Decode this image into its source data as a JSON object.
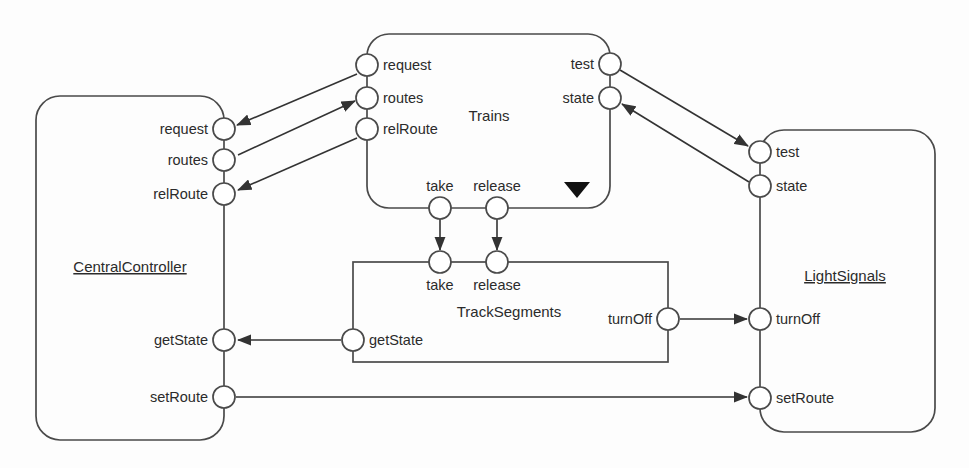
{
  "diagram": {
    "kind": "uml-component-connector-diagram",
    "stroke_color": "#4a4a4a",
    "connector_color": "#333333",
    "text_color": "#2b2b2b",
    "background": "#ffffff",
    "width": 969,
    "height": 468
  },
  "components": [
    {
      "id": "central-controller",
      "name": "CentralController",
      "underlined": true,
      "shape": "rounded",
      "label_x": 130,
      "label_y": 272,
      "box": {
        "x": 36,
        "y": 96,
        "width": 188,
        "height": 344,
        "rx": 24
      },
      "ports": [
        {
          "id": "cc-request",
          "label": "request",
          "cx": 224,
          "cy": 129,
          "label_side": "left"
        },
        {
          "id": "cc-routes",
          "label": "routes",
          "cx": 224,
          "cy": 160,
          "label_side": "left"
        },
        {
          "id": "cc-relroute",
          "label": "relRoute",
          "cx": 224,
          "cy": 194,
          "label_side": "left"
        },
        {
          "id": "cc-getstate",
          "label": "getState",
          "cx": 224,
          "cy": 340,
          "label_side": "left"
        },
        {
          "id": "cc-setroute",
          "label": "setRoute",
          "cx": 224,
          "cy": 397,
          "label_side": "left"
        }
      ]
    },
    {
      "id": "trains",
      "name": "Trains",
      "underlined": false,
      "shape": "rounded",
      "label_x": 489,
      "label_y": 121,
      "box": {
        "x": 367,
        "y": 34,
        "width": 243,
        "height": 174,
        "rx": 22
      },
      "ports": [
        {
          "id": "tr-request",
          "label": "request",
          "cx": 367,
          "cy": 65,
          "label_side": "right"
        },
        {
          "id": "tr-routes",
          "label": "routes",
          "cx": 367,
          "cy": 98,
          "label_side": "right"
        },
        {
          "id": "tr-relroute",
          "label": "relRoute",
          "cx": 367,
          "cy": 129,
          "label_side": "right"
        },
        {
          "id": "tr-test",
          "label": "test",
          "cx": 610,
          "cy": 64,
          "label_side": "left"
        },
        {
          "id": "tr-state",
          "label": "state",
          "cx": 610,
          "cy": 98,
          "label_side": "left"
        },
        {
          "id": "tr-take",
          "label": "take",
          "cx": 440,
          "cy": 208,
          "label_side": "above"
        },
        {
          "id": "tr-release",
          "label": "release",
          "cx": 497,
          "cy": 208,
          "label_side": "above"
        }
      ]
    },
    {
      "id": "track-segments",
      "name": "TrackSegments",
      "underlined": false,
      "shape": "sharp",
      "label_x": 509,
      "label_y": 317,
      "box": {
        "x": 353,
        "y": 262,
        "width": 315,
        "height": 100,
        "rx": 0
      },
      "ports": [
        {
          "id": "ts-take",
          "label": "take",
          "cx": 440,
          "cy": 262,
          "label_side": "below"
        },
        {
          "id": "ts-release",
          "label": "release",
          "cx": 497,
          "cy": 262,
          "label_side": "below"
        },
        {
          "id": "ts-getstate",
          "label": "getState",
          "cx": 353,
          "cy": 340,
          "label_side": "right"
        },
        {
          "id": "ts-turnoff",
          "label": "turnOff",
          "cx": 668,
          "cy": 319,
          "label_side": "left"
        }
      ]
    },
    {
      "id": "light-signals",
      "name": "LightSignals",
      "underlined": true,
      "shape": "rounded",
      "label_x": 845,
      "label_y": 281,
      "box": {
        "x": 760,
        "y": 130,
        "width": 175,
        "height": 302,
        "rx": 24
      },
      "ports": [
        {
          "id": "ls-test",
          "label": "test",
          "cx": 760,
          "cy": 152,
          "label_side": "right"
        },
        {
          "id": "ls-state",
          "label": "state",
          "cx": 760,
          "cy": 186,
          "label_side": "right"
        },
        {
          "id": "ls-turnoff",
          "label": "turnOff",
          "cx": 760,
          "cy": 319,
          "label_side": "right"
        },
        {
          "id": "ls-setroute",
          "label": "setRoute",
          "cx": 760,
          "cy": 398,
          "label_side": "right"
        }
      ]
    }
  ],
  "port_radius": 11,
  "connectors": [
    {
      "id": "conn-request",
      "from": "tr-request",
      "to": "cc-request",
      "d": "M 357 74 L 237 125",
      "arrow_at_end": true
    },
    {
      "id": "conn-routes",
      "from": "cc-routes",
      "to": "tr-routes",
      "d": "M 238 155 L 355 101",
      "arrow_at_end": true
    },
    {
      "id": "conn-relroute",
      "from": "tr-relroute",
      "to": "cc-relroute",
      "d": "M 357 138 L 238 190",
      "arrow_at_end": true
    },
    {
      "id": "conn-take",
      "from": "tr-take",
      "to": "ts-take",
      "d": "M 440 219 L 440 250",
      "arrow_at_end": true
    },
    {
      "id": "conn-release",
      "from": "tr-release",
      "to": "ts-release",
      "d": "M 497 219 L 497 250",
      "arrow_at_end": true
    },
    {
      "id": "conn-test",
      "from": "tr-test",
      "to": "ls-test",
      "d": "M 620 70 L 748 146",
      "arrow_at_end": true
    },
    {
      "id": "conn-state",
      "from": "ls-state",
      "to": "tr-state",
      "d": "M 749 182 L 622 104",
      "arrow_at_end": true
    },
    {
      "id": "conn-getstate",
      "from": "ts-getstate",
      "to": "cc-getstate",
      "d": "M 341 340 L 238 340",
      "arrow_at_end": true
    },
    {
      "id": "conn-turnoff",
      "from": "ts-turnoff",
      "to": "ls-turnoff",
      "d": "M 680 319 L 747 319",
      "arrow_at_end": true
    },
    {
      "id": "conn-setroute",
      "from": "cc-setroute",
      "to": "ls-setroute",
      "d": "M 236 397 L 747 397",
      "arrow_at_end": true
    }
  ],
  "markers": [
    {
      "id": "trains-collection-marker",
      "glyph": "filled-down-triangle",
      "cx": 577,
      "cy": 188
    }
  ]
}
